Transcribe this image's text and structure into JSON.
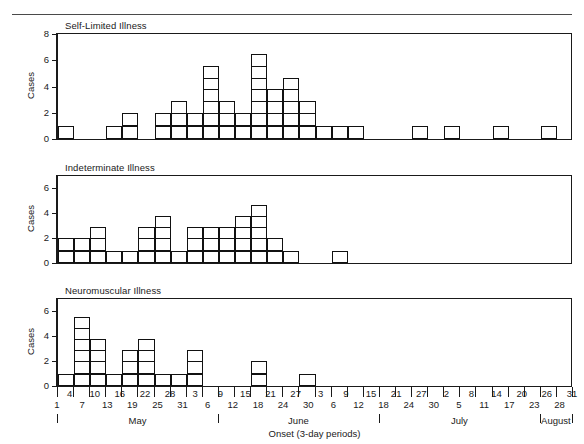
{
  "figure": {
    "axis_title": "Onset (3-day periods)",
    "y_axis_label": "Cases",
    "ink_color": "#111111",
    "background": "#ffffff"
  },
  "chart_data": {
    "type": "bar",
    "title": "",
    "xlabel": "Onset (3-day periods)",
    "ylabel": "Cases",
    "grid": false,
    "legend": "none",
    "bin_count": 32,
    "bin_description": "3-day onset periods from May 1 through August 31",
    "x_tick_labels_upper": [
      "4",
      "10",
      "16",
      "22",
      "28",
      "3",
      "9",
      "15",
      "21",
      "27",
      "3",
      "9",
      "15",
      "21",
      "27",
      "2",
      "8",
      "14",
      "20",
      "26",
      "31"
    ],
    "x_tick_labels_lower": [
      "1",
      "7",
      "13",
      "19",
      "25",
      "31",
      "6",
      "12",
      "18",
      "24",
      "30",
      "6",
      "12",
      "18",
      "24",
      "30",
      "5",
      "11",
      "17",
      "23",
      "28"
    ],
    "x_tick_labels_all": [
      "1",
      "4",
      "7",
      "10",
      "13",
      "16",
      "19",
      "22",
      "25",
      "28",
      "31",
      "3",
      "6",
      "9",
      "12",
      "15",
      "18",
      "21",
      "24",
      "27",
      "30",
      "3",
      "6",
      "9",
      "12",
      "15",
      "18",
      "21",
      "24",
      "27",
      "30",
      "2",
      "5",
      "8",
      "11",
      "14",
      "17",
      "20",
      "23",
      "26",
      "28",
      "31"
    ],
    "months": [
      {
        "label": "May",
        "start_bin": 0,
        "end_bin": 10
      },
      {
        "label": "June",
        "start_bin": 10,
        "end_bin": 20
      },
      {
        "label": "July",
        "start_bin": 20,
        "end_bin": 30
      },
      {
        "label": "August",
        "start_bin": 30,
        "end_bin": 32
      }
    ],
    "panels": [
      {
        "title": "Self-Limited Illness",
        "ylabel": "Cases",
        "ylim": [
          0,
          8
        ],
        "yticks": [
          0,
          2,
          4,
          6,
          8
        ],
        "values": [
          1,
          0,
          0,
          1,
          2,
          0,
          2,
          3,
          2,
          6,
          3,
          2,
          7,
          4,
          5,
          3,
          1,
          1,
          1,
          0,
          0,
          0,
          1,
          0,
          1,
          0,
          0,
          1,
          0,
          0,
          1,
          0
        ]
      },
      {
        "title": "Indeterminate Illness",
        "ylabel": "Cases",
        "ylim": [
          0,
          7
        ],
        "yticks": [
          0,
          2,
          4,
          6
        ],
        "values": [
          2,
          2,
          3,
          1,
          1,
          3,
          4,
          1,
          3,
          3,
          3,
          4,
          5,
          2,
          1,
          0,
          0,
          1,
          0,
          0,
          0,
          0,
          0,
          0,
          0,
          0,
          0,
          0,
          0,
          0,
          0,
          0
        ]
      },
      {
        "title": "Neuromuscular Illness",
        "ylabel": "Cases",
        "ylim": [
          0,
          7
        ],
        "yticks": [
          0,
          2,
          4,
          6
        ],
        "values": [
          1,
          6,
          4,
          1,
          3,
          4,
          1,
          1,
          3,
          0,
          0,
          0,
          2,
          0,
          0,
          1,
          0,
          0,
          0,
          0,
          0,
          0,
          0,
          0,
          0,
          0,
          0,
          0,
          0,
          0,
          0,
          0
        ]
      }
    ]
  }
}
